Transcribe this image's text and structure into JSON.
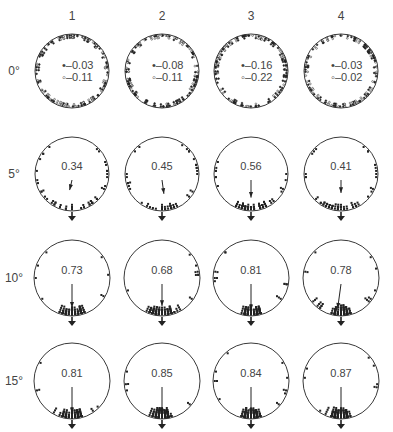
{
  "columns": [
    {
      "label": "1",
      "cx": 72
    },
    {
      "label": "2",
      "cx": 162
    },
    {
      "label": "3",
      "cx": 251
    },
    {
      "label": "4",
      "cx": 341
    }
  ],
  "column_label_y": 16,
  "rows": [
    {
      "label": "0°",
      "cy": 71,
      "r": 37,
      "type": "uniform",
      "cells": [
        {
          "filled": "–0.03",
          "open": "–0.11"
        },
        {
          "filled": "–0.08",
          "open": "–0.11"
        },
        {
          "filled": "–0.16",
          "open": "–0.22"
        },
        {
          "filled": "–0.03",
          "open": "–0.02"
        }
      ]
    },
    {
      "label": "5°",
      "cy": 174,
      "r": 37,
      "type": "oriented",
      "cells": [
        {
          "value": "0.34",
          "r_len": 0.34,
          "angle": 20,
          "n": 40
        },
        {
          "value": "0.45",
          "r_len": 0.45,
          "angle": -12,
          "n": 42
        },
        {
          "value": "0.56",
          "r_len": 0.56,
          "angle": 0,
          "n": 45
        },
        {
          "value": "0.41",
          "r_len": 0.41,
          "angle": 0,
          "n": 42
        }
      ]
    },
    {
      "label": "10°",
      "cy": 278,
      "r": 38,
      "type": "oriented",
      "cells": [
        {
          "value": "0.73",
          "r_len": 0.73,
          "angle": 0,
          "n": 48
        },
        {
          "value": "0.68",
          "r_len": 0.68,
          "angle": 0,
          "n": 48
        },
        {
          "value": "0.81",
          "r_len": 0.81,
          "angle": 0,
          "n": 52
        },
        {
          "value": "0.78",
          "r_len": 0.78,
          "angle": 12,
          "n": 58
        }
      ]
    },
    {
      "label": "15°",
      "cy": 381,
      "r": 38,
      "type": "oriented",
      "cells": [
        {
          "value": "0.81",
          "r_len": 0.81,
          "angle": 0,
          "n": 55
        },
        {
          "value": "0.85",
          "r_len": 0.85,
          "angle": 0,
          "n": 58
        },
        {
          "value": "0.84",
          "r_len": 0.84,
          "angle": 0,
          "n": 60
        },
        {
          "value": "0.87",
          "r_len": 0.87,
          "angle": 0,
          "n": 58
        }
      ]
    }
  ],
  "legend_symbols": {
    "filled": "•",
    "open": "◦"
  },
  "colors": {
    "ink": "#222222",
    "text": "#444444",
    "background": "#ffffff"
  }
}
